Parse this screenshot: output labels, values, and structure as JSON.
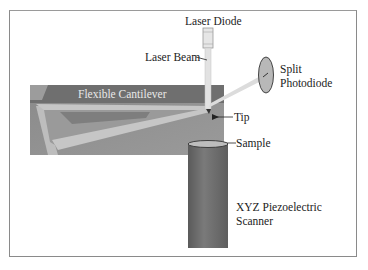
{
  "diagram": {
    "labels": {
      "laser_diode": "Laser Diode",
      "laser_beam": "Laser Beam",
      "split_photodiode_line1": "Split",
      "split_photodiode_line2": "Photodiode",
      "flexible_cantilever": "Flexible Cantilever",
      "tip": "Tip",
      "sample": "Sample",
      "scanner_line1": "XYZ Piezoelectric",
      "scanner_line2": "Scanner"
    },
    "colors": {
      "background": "#ffffff",
      "frame": "#8a8a8a",
      "cantilever_block": "#8e8e8e",
      "cantilever_band": "#6f6f6f",
      "cantilever_arm": "#c4c4c4",
      "scanner": "#6a6a6a",
      "beam": "#d8d8d8",
      "photodiode": "#b8b8b8",
      "text": "#222222"
    }
  }
}
